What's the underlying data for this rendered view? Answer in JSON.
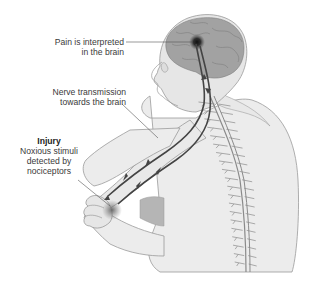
{
  "diagram": {
    "labels": {
      "pain": {
        "lines": [
          "Pain is interpreted",
          "in the brain"
        ]
      },
      "nerve": {
        "lines": [
          "Nerve transmission",
          "towards the brain"
        ]
      },
      "injury": {
        "title": "Injury",
        "lines": [
          "Noxious stimuli",
          "detected by",
          "nociceptors"
        ]
      }
    },
    "colors": {
      "skin": "#ececec",
      "skin_outline": "#9a9a9a",
      "brain": "#9c9c9c",
      "nerve": "#444444",
      "spine": "#8a8a8a",
      "pain_spot": "#1a1a1a",
      "injury_spot": "#7a7a7a",
      "shadow": "#b5b5b5"
    }
  }
}
